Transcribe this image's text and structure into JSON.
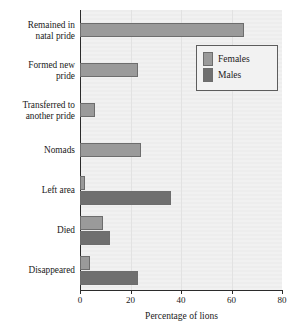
{
  "chart_data": {
    "type": "bar",
    "orientation": "horizontal",
    "title": "",
    "xlabel": "Percentage of lions",
    "ylabel": "",
    "xlim": [
      0,
      80
    ],
    "xticks": [
      0,
      20,
      40,
      60,
      80
    ],
    "xtick_labels": [
      "0",
      "20",
      "40",
      "60",
      "80"
    ],
    "grid": true,
    "legend_position": "top-right",
    "categories": [
      "Remained in natal pride",
      "Formed new pride",
      "Transferred to another pride",
      "Nomads",
      "Left area",
      "Died",
      "Disappeared"
    ],
    "category_labels": [
      [
        "Remained in",
        "natal pride"
      ],
      [
        "Formed new",
        "pride"
      ],
      [
        "Transferred to",
        "another pride"
      ],
      [
        "Nomads"
      ],
      [
        "Left area"
      ],
      [
        "Died"
      ],
      [
        "Disappeared"
      ]
    ],
    "series": [
      {
        "name": "Females",
        "color": "#9a9a9a",
        "values": [
          65,
          23,
          6,
          24,
          2,
          9,
          4
        ]
      },
      {
        "name": "Males",
        "color": "#6f6f6f",
        "values": [
          0,
          0,
          0,
          0,
          36,
          12,
          23
        ]
      }
    ]
  },
  "legend": {
    "items": [
      {
        "label": "Females",
        "swatch": "females"
      },
      {
        "label": "Males",
        "swatch": "males"
      }
    ]
  },
  "axis": {
    "x_title": "Percentage of lions"
  },
  "colors": {
    "females": "#9a9a9a",
    "males": "#6f6f6f",
    "plot_background": "#eeeeee",
    "axis": "#2b2b2b"
  }
}
